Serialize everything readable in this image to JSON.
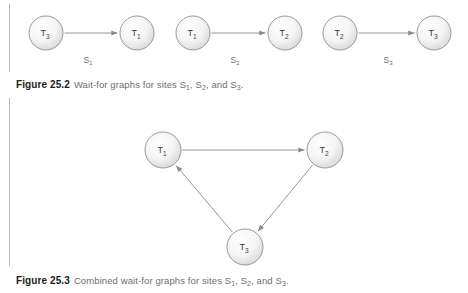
{
  "page": {
    "background_color": "#ffffff",
    "rule_color": "#b9b9b9",
    "node_fill_light": "#f5f5f5",
    "node_fill_dark": "#d6d6d6",
    "node_stroke": "#8f8f8f",
    "edge_color": "#8a8a8a",
    "text_color": "#3b3b3b",
    "caption_label_color": "#1b1b1b",
    "caption_text_color": "#6e6e6e"
  },
  "figure_252": {
    "caption_label": "Figure 25.2",
    "caption_text_before": "Wait-for graphs for sites ",
    "caption_parts": [
      "S",
      "1",
      ", S",
      "2",
      ", and S",
      "3",
      "."
    ],
    "caption_full": "Wait-for graphs for sites S1, S2, and S3.",
    "graphs": [
      {
        "site_label_base": "S",
        "site_label_sub": "1",
        "nodes": [
          {
            "id": "n1",
            "label_base": "T",
            "label_sub": "3",
            "cx": 46,
            "cy": 33,
            "r": 17
          },
          {
            "id": "n2",
            "label_base": "T",
            "label_sub": "1",
            "cx": 137,
            "cy": 33,
            "r": 17
          }
        ],
        "edges": [
          {
            "from": "n1",
            "to": "n2",
            "directed": true
          }
        ],
        "site_x": 88,
        "site_y": 63
      },
      {
        "site_label_base": "S",
        "site_label_sub": "2",
        "nodes": [
          {
            "id": "n1",
            "label_base": "T",
            "label_sub": "1",
            "cx": 193,
            "cy": 33,
            "r": 17
          },
          {
            "id": "n2",
            "label_base": "T",
            "label_sub": "2",
            "cx": 285,
            "cy": 33,
            "r": 17
          }
        ],
        "edges": [
          {
            "from": "n1",
            "to": "n2",
            "directed": true
          }
        ],
        "site_x": 235,
        "site_y": 63
      },
      {
        "site_label_base": "S",
        "site_label_sub": "3",
        "nodes": [
          {
            "id": "n1",
            "label_base": "T",
            "label_sub": "2",
            "cx": 340,
            "cy": 33,
            "r": 17
          },
          {
            "id": "n2",
            "label_base": "T",
            "label_sub": "3",
            "cx": 434,
            "cy": 33,
            "r": 17
          }
        ],
        "edges": [
          {
            "from": "n1",
            "to": "n2",
            "directed": true
          }
        ],
        "site_x": 388,
        "site_y": 63
      }
    ]
  },
  "figure_253": {
    "caption_label": "Figure 25.3",
    "caption_full": "Combined wait-for graphs for sites S1, S2, and S3.",
    "graph": {
      "nodes": [
        {
          "id": "t1",
          "label_base": "T",
          "label_sub": "1",
          "cx": 163,
          "cy": 150,
          "r": 18
        },
        {
          "id": "t2",
          "label_base": "T",
          "label_sub": "2",
          "cx": 325,
          "cy": 150,
          "r": 18
        },
        {
          "id": "t3",
          "label_base": "T",
          "label_sub": "3",
          "cx": 245,
          "cy": 247,
          "r": 18
        }
      ],
      "edges": [
        {
          "from": "t1",
          "to": "t2",
          "directed": true
        },
        {
          "from": "t2",
          "to": "t3",
          "directed": true
        },
        {
          "from": "t3",
          "to": "t1",
          "directed": true
        }
      ]
    }
  }
}
